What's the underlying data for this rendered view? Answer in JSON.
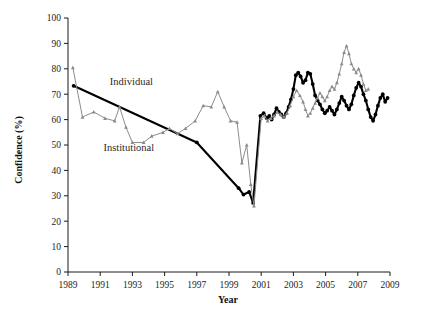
{
  "chart_data": {
    "type": "line",
    "title": "",
    "xlabel": "Year",
    "ylabel": "Confidence (%)",
    "xlim": [
      1989,
      2009
    ],
    "ylim": [
      0,
      100
    ],
    "grid": false,
    "legend_position": "inline-annotation",
    "xticks": [
      "1989",
      "1991",
      "1993",
      "1995",
      "1997",
      "1999",
      "2001",
      "2003",
      "2005",
      "2007",
      "2009"
    ],
    "xtick_values": [
      1989,
      1991,
      1993,
      1995,
      1997,
      1999,
      2001,
      2003,
      2005,
      2007,
      2009
    ],
    "yticks": [
      "0",
      "10",
      "20",
      "30",
      "40",
      "50",
      "60",
      "70",
      "80",
      "90",
      "100"
    ],
    "ytick_values": [
      0,
      10,
      20,
      30,
      40,
      50,
      60,
      70,
      80,
      90,
      100
    ],
    "series": [
      {
        "name": "Individual",
        "color": "#000000",
        "style": "thick-line-with-dots",
        "annotation_label": "Individual",
        "annotation_x": 1991.6,
        "annotation_y": 73.5,
        "points": [
          [
            1989.35,
            73.3
          ],
          [
            1997.0,
            51.0
          ],
          [
            1999.6,
            33.0
          ],
          [
            1999.9,
            30.5
          ],
          [
            2000.25,
            31.5
          ],
          [
            2000.5,
            27.2
          ],
          [
            2000.95,
            61.5
          ],
          [
            2001.15,
            62.5
          ],
          [
            2001.35,
            60.5
          ],
          [
            2001.5,
            61.5
          ],
          [
            2001.65,
            60.0
          ],
          [
            2001.8,
            62.0
          ],
          [
            2001.95,
            64.5
          ],
          [
            2002.1,
            63.0
          ],
          [
            2002.25,
            62.0
          ],
          [
            2002.4,
            61.0
          ],
          [
            2002.55,
            62.5
          ],
          [
            2002.7,
            65.0
          ],
          [
            2002.85,
            68.0
          ],
          [
            2003.0,
            72.0
          ],
          [
            2003.15,
            77.5
          ],
          [
            2003.3,
            78.5
          ],
          [
            2003.45,
            77.0
          ],
          [
            2003.6,
            74.5
          ],
          [
            2003.75,
            75.5
          ],
          [
            2003.9,
            78.5
          ],
          [
            2004.05,
            78.0
          ],
          [
            2004.2,
            74.0
          ],
          [
            2004.35,
            69.5
          ],
          [
            2004.5,
            67.5
          ],
          [
            2004.65,
            66.0
          ],
          [
            2004.8,
            64.0
          ],
          [
            2004.95,
            62.5
          ],
          [
            2005.1,
            63.5
          ],
          [
            2005.25,
            65.0
          ],
          [
            2005.4,
            63.5
          ],
          [
            2005.55,
            62.0
          ],
          [
            2005.7,
            64.0
          ],
          [
            2005.85,
            66.5
          ],
          [
            2006.0,
            69.0
          ],
          [
            2006.15,
            67.5
          ],
          [
            2006.3,
            65.5
          ],
          [
            2006.45,
            64.0
          ],
          [
            2006.6,
            66.0
          ],
          [
            2006.75,
            69.5
          ],
          [
            2006.9,
            72.5
          ],
          [
            2007.05,
            74.5
          ],
          [
            2007.2,
            73.0
          ],
          [
            2007.35,
            70.0
          ],
          [
            2007.5,
            67.5
          ],
          [
            2007.65,
            64.0
          ],
          [
            2007.8,
            61.0
          ],
          [
            2007.95,
            59.5
          ],
          [
            2008.1,
            62.0
          ],
          [
            2008.25,
            65.5
          ],
          [
            2008.4,
            68.5
          ],
          [
            2008.55,
            70.0
          ],
          [
            2008.7,
            67.0
          ],
          [
            2008.85,
            68.5
          ]
        ]
      },
      {
        "name": "Institutional",
        "color": "#8c8c8c",
        "style": "thin-line-with-triangles",
        "annotation_label": "Institutional",
        "annotation_x": 1991.2,
        "annotation_y": 47.5,
        "points": [
          [
            1989.3,
            80.5
          ],
          [
            1989.9,
            61.0
          ],
          [
            1990.6,
            63.0
          ],
          [
            1991.3,
            60.5
          ],
          [
            1991.9,
            59.5
          ],
          [
            1992.2,
            65.0
          ],
          [
            1992.6,
            57.0
          ],
          [
            1993.0,
            51.0
          ],
          [
            1993.7,
            51.0
          ],
          [
            1994.2,
            53.5
          ],
          [
            1994.9,
            55.0
          ],
          [
            1995.3,
            56.5
          ],
          [
            1995.8,
            54.5
          ],
          [
            1996.3,
            56.5
          ],
          [
            1996.9,
            59.5
          ],
          [
            1997.4,
            65.5
          ],
          [
            1997.9,
            65.0
          ],
          [
            1998.3,
            71.0
          ],
          [
            1998.7,
            65.0
          ],
          [
            1999.1,
            59.5
          ],
          [
            1999.5,
            59.0
          ],
          [
            1999.8,
            43.0
          ],
          [
            2000.1,
            50.0
          ],
          [
            2000.35,
            34.5
          ],
          [
            2000.55,
            26.0
          ],
          [
            2001.0,
            60.5
          ],
          [
            2001.2,
            61.5
          ],
          [
            2001.4,
            59.5
          ],
          [
            2001.6,
            60.5
          ],
          [
            2001.8,
            61.5
          ],
          [
            2002.0,
            63.0
          ],
          [
            2002.2,
            62.0
          ],
          [
            2002.4,
            61.0
          ],
          [
            2002.6,
            62.5
          ],
          [
            2002.8,
            65.5
          ],
          [
            2003.0,
            69.0
          ],
          [
            2003.2,
            71.5
          ],
          [
            2003.4,
            69.5
          ],
          [
            2003.6,
            67.0
          ],
          [
            2003.75,
            64.0
          ],
          [
            2003.9,
            61.5
          ],
          [
            2004.05,
            62.5
          ],
          [
            2004.2,
            64.5
          ],
          [
            2004.35,
            66.5
          ],
          [
            2004.5,
            68.5
          ],
          [
            2004.65,
            70.5
          ],
          [
            2004.8,
            69.0
          ],
          [
            2004.95,
            67.5
          ],
          [
            2005.1,
            69.0
          ],
          [
            2005.25,
            71.5
          ],
          [
            2005.4,
            73.0
          ],
          [
            2005.55,
            72.0
          ],
          [
            2005.7,
            74.5
          ],
          [
            2005.85,
            78.0
          ],
          [
            2006.0,
            82.0
          ],
          [
            2006.15,
            86.5
          ],
          [
            2006.3,
            89.0
          ],
          [
            2006.45,
            86.0
          ],
          [
            2006.6,
            82.0
          ],
          [
            2006.75,
            80.0
          ],
          [
            2006.9,
            78.5
          ],
          [
            2007.05,
            80.0
          ],
          [
            2007.2,
            77.5
          ],
          [
            2007.35,
            74.0
          ],
          [
            2007.5,
            71.5
          ],
          [
            2007.65,
            72.0
          ]
        ]
      }
    ]
  }
}
